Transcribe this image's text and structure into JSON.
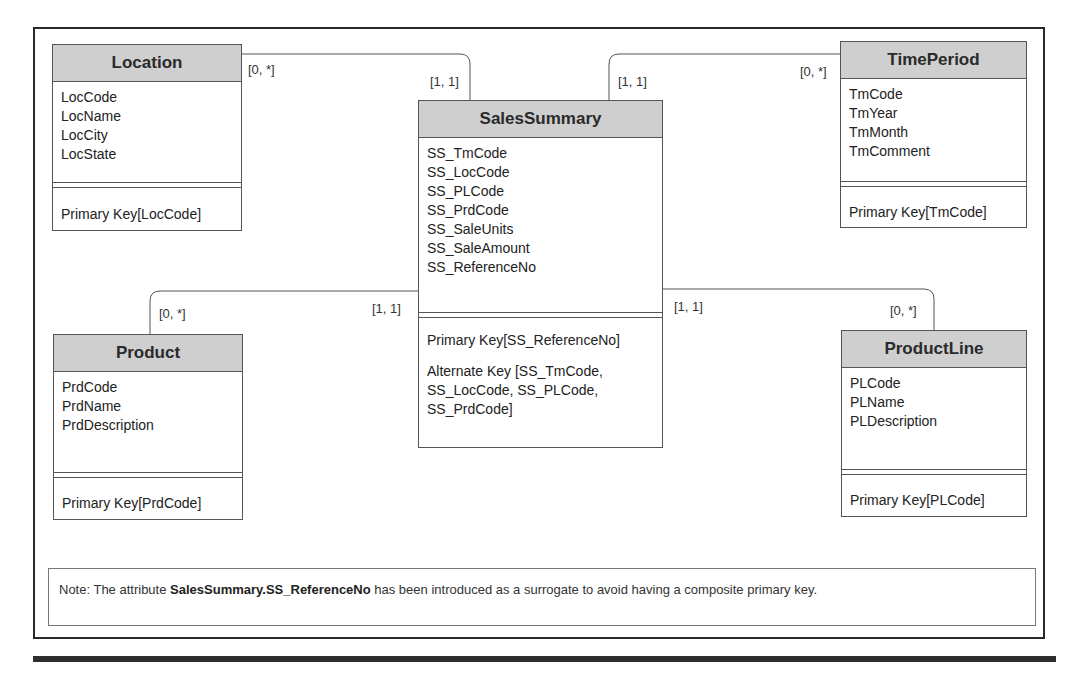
{
  "diagram": {
    "entities": {
      "location": {
        "name": "Location",
        "attributes": [
          "LocCode",
          "LocName",
          "LocCity",
          "LocState"
        ],
        "keys": [
          "Primary Key[LocCode]"
        ]
      },
      "time_period": {
        "name": "TimePeriod",
        "attributes": [
          "TmCode",
          "TmYear",
          "TmMonth",
          "TmComment"
        ],
        "keys": [
          "Primary Key[TmCode]"
        ]
      },
      "sales_summary": {
        "name": "SalesSummary",
        "attributes": [
          "SS_TmCode",
          "SS_LocCode",
          "SS_PLCode",
          "SS_PrdCode",
          "SS_SaleUnits",
          "SS_SaleAmount",
          "SS_ReferenceNo"
        ],
        "keys": [
          "Primary Key[SS_ReferenceNo]",
          "Alternate Key [SS_TmCode,",
          "SS_LocCode, SS_PLCode,",
          "SS_PrdCode]"
        ]
      },
      "product": {
        "name": "Product",
        "attributes": [
          "PrdCode",
          "PrdName",
          "PrdDescription"
        ],
        "keys": [
          "Primary Key[PrdCode]"
        ]
      },
      "product_line": {
        "name": "ProductLine",
        "attributes": [
          "PLCode",
          "PLName",
          "PLDescription"
        ],
        "keys": [
          "Primary Key[PLCode]"
        ]
      }
    },
    "relationships": [
      {
        "from": "Location",
        "to": "SalesSummary",
        "from_card": "[0, *]",
        "to_card": "[1, 1]"
      },
      {
        "from": "TimePeriod",
        "to": "SalesSummary",
        "from_card": "[0, *]",
        "to_card": "[1, 1]"
      },
      {
        "from": "Product",
        "to": "SalesSummary",
        "from_card": "[0, *]",
        "to_card": "[1, 1]"
      },
      {
        "from": "ProductLine",
        "to": "SalesSummary",
        "from_card": "[0, *]",
        "to_card": "[1, 1]"
      }
    ],
    "note": {
      "prefix": "Note: The attribute ",
      "bold": "SalesSummary.SS_ReferenceNo",
      "suffix": " has been introduced as a surrogate to avoid having a composite primary key."
    }
  }
}
